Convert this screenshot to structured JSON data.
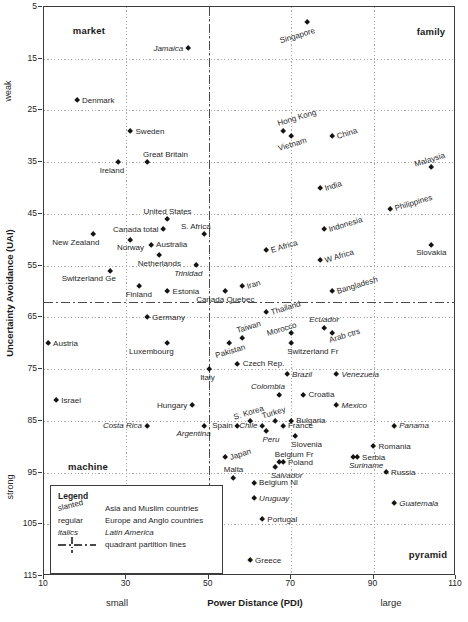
{
  "figure": {
    "quadrants": {
      "top_left": "market",
      "top_right": "family",
      "bottom_left": "machine",
      "bottom_right": "pyramid"
    },
    "axes": {
      "x_title": "Power Distance (PDI)",
      "x_left_label": "small",
      "x_right_label": "large",
      "y_title": "Uncertainty Avoidance (UAI)",
      "y_top_label": "weak",
      "y_bottom_label": "strong"
    },
    "legend": {
      "title": "Legend",
      "rows": [
        {
          "key": "slanted",
          "desc": "Asia and Muslim countries"
        },
        {
          "key": "regular",
          "desc": "Europe and Anglo countries"
        },
        {
          "key": "italics",
          "desc": "Latin America"
        },
        {
          "key": "partition-line-symbol",
          "desc": "quadrant partition lines"
        }
      ]
    }
  },
  "chart_data": {
    "type": "scatter",
    "xlabel": "Power Distance (PDI)",
    "ylabel": "Uncertainty Avoidance (UAI)",
    "xlim": [
      10,
      110
    ],
    "ylim": [
      5,
      115
    ],
    "y_axis_inverted": true,
    "x_ticks": [
      10,
      30,
      50,
      70,
      90,
      110
    ],
    "y_ticks": [
      5,
      15,
      25,
      35,
      45,
      55,
      65,
      75,
      85,
      95,
      105,
      115
    ],
    "x_gridlines": [
      30,
      50,
      70,
      90
    ],
    "y_gridlines": [
      15,
      25,
      35,
      45,
      55,
      65,
      75,
      85,
      95,
      105
    ],
    "partition_lines": {
      "x": 50,
      "y": 62
    },
    "group_legend": {
      "slanted": "Asia and Muslim countries",
      "regular": "Europe and Anglo countries",
      "italics": "Latin America"
    },
    "points": [
      {
        "name": "Singapore",
        "pdi": 74,
        "uai": 8,
        "group": "slanted",
        "pos": "below-left"
      },
      {
        "name": "Jamaica",
        "pdi": 45,
        "uai": 13,
        "group": "italics",
        "pos": "left"
      },
      {
        "name": "Denmark",
        "pdi": 18,
        "uai": 23,
        "group": "regular",
        "pos": "right"
      },
      {
        "name": "Sweden",
        "pdi": 31,
        "uai": 29,
        "group": "regular",
        "pos": "right"
      },
      {
        "name": "Hong Kong",
        "pdi": 68,
        "uai": 29,
        "group": "slanted",
        "pos": "above-right"
      },
      {
        "name": "Vietnam",
        "pdi": 70,
        "uai": 30,
        "group": "slanted",
        "pos": "below"
      },
      {
        "name": "China",
        "pdi": 80,
        "uai": 30,
        "group": "slanted",
        "pos": "right"
      },
      {
        "name": "Great Britain",
        "pdi": 35,
        "uai": 35,
        "group": "regular",
        "pos": "above-right"
      },
      {
        "name": "Ireland",
        "pdi": 28,
        "uai": 35,
        "group": "regular",
        "pos": "below-left"
      },
      {
        "name": "Malaysia",
        "pdi": 104,
        "uai": 36,
        "group": "slanted",
        "pos": "above"
      },
      {
        "name": "India",
        "pdi": 77,
        "uai": 40,
        "group": "slanted",
        "pos": "right"
      },
      {
        "name": "Philippines",
        "pdi": 94,
        "uai": 44,
        "group": "slanted",
        "pos": "right"
      },
      {
        "name": "United States",
        "pdi": 40,
        "uai": 46,
        "group": "regular",
        "pos": "above"
      },
      {
        "name": "Canada total",
        "pdi": 39,
        "uai": 48,
        "group": "regular",
        "pos": "left"
      },
      {
        "name": "S. Africa",
        "pdi": 49,
        "uai": 49,
        "group": "regular",
        "pos": "above-left"
      },
      {
        "name": "Indonesia",
        "pdi": 78,
        "uai": 48,
        "group": "slanted",
        "pos": "right"
      },
      {
        "name": "New Zealand",
        "pdi": 22,
        "uai": 49,
        "group": "regular",
        "pos": "below-left"
      },
      {
        "name": "Norway",
        "pdi": 31,
        "uai": 50,
        "group": "regular",
        "pos": "below"
      },
      {
        "name": "Australia",
        "pdi": 36,
        "uai": 51,
        "group": "regular",
        "pos": "right"
      },
      {
        "name": "Slovakia",
        "pdi": 104,
        "uai": 51,
        "group": "regular",
        "pos": "below"
      },
      {
        "name": "E Africa",
        "pdi": 64,
        "uai": 52,
        "group": "slanted",
        "pos": "right"
      },
      {
        "name": "Netherlands",
        "pdi": 38,
        "uai": 53,
        "group": "regular",
        "pos": "below"
      },
      {
        "name": "W Africa",
        "pdi": 77,
        "uai": 54,
        "group": "slanted",
        "pos": "right"
      },
      {
        "name": "Trinidad",
        "pdi": 47,
        "uai": 55,
        "group": "italics",
        "pos": "below-left"
      },
      {
        "name": "Switzerland Ge",
        "pdi": 26,
        "uai": 56,
        "group": "regular",
        "pos": "below-left"
      },
      {
        "name": "Iran",
        "pdi": 58,
        "uai": 59,
        "group": "slanted",
        "pos": "right"
      },
      {
        "name": "Finland",
        "pdi": 33,
        "uai": 59,
        "group": "regular",
        "pos": "below"
      },
      {
        "name": "Estonia",
        "pdi": 40,
        "uai": 60,
        "group": "regular",
        "pos": "right"
      },
      {
        "name": "Canada Quebec",
        "pdi": 54,
        "uai": 60,
        "group": "regular",
        "pos": "below"
      },
      {
        "name": "Bangladesh",
        "pdi": 80,
        "uai": 60,
        "group": "slanted",
        "pos": "right"
      },
      {
        "name": "Germany",
        "pdi": 35,
        "uai": 65,
        "group": "regular",
        "pos": "right"
      },
      {
        "name": "Thailand",
        "pdi": 64,
        "uai": 64,
        "group": "slanted",
        "pos": "right"
      },
      {
        "name": "Ecuador",
        "pdi": 78,
        "uai": 67,
        "group": "italics",
        "pos": "above"
      },
      {
        "name": "Taiwan",
        "pdi": 58,
        "uai": 69,
        "group": "slanted",
        "pos": "above-right"
      },
      {
        "name": "Morocco",
        "pdi": 70,
        "uai": 68,
        "group": "slanted",
        "pos": "above-left"
      },
      {
        "name": "Arab ctrs",
        "pdi": 80,
        "uai": 68,
        "group": "slanted",
        "pos": "below-right"
      },
      {
        "name": "Austria",
        "pdi": 11,
        "uai": 70,
        "group": "regular",
        "pos": "right"
      },
      {
        "name": "Luxembourg",
        "pdi": 40,
        "uai": 70,
        "group": "regular",
        "pos": "below-left"
      },
      {
        "name": "Pakistan",
        "pdi": 55,
        "uai": 70,
        "group": "slanted",
        "pos": "below"
      },
      {
        "name": "Switzerland Fr",
        "pdi": 70,
        "uai": 70,
        "group": "regular",
        "pos": "below-right"
      },
      {
        "name": "Czech Rep.",
        "pdi": 57,
        "uai": 74,
        "group": "regular",
        "pos": "right"
      },
      {
        "name": "Italy",
        "pdi": 50,
        "uai": 75,
        "group": "regular",
        "pos": "below-left"
      },
      {
        "name": "Brazil",
        "pdi": 69,
        "uai": 76,
        "group": "italics",
        "pos": "right"
      },
      {
        "name": "Venezuela",
        "pdi": 81,
        "uai": 76,
        "group": "italics",
        "pos": "right"
      },
      {
        "name": "Israel",
        "pdi": 13,
        "uai": 81,
        "group": "regular",
        "pos": "right"
      },
      {
        "name": "Colombia",
        "pdi": 67,
        "uai": 80,
        "group": "italics",
        "pos": "above-left"
      },
      {
        "name": "Croatia",
        "pdi": 73,
        "uai": 80,
        "group": "regular",
        "pos": "right"
      },
      {
        "name": "Hungary",
        "pdi": 46,
        "uai": 82,
        "group": "regular",
        "pos": "left"
      },
      {
        "name": "Mexico",
        "pdi": 81,
        "uai": 82,
        "group": "italics",
        "pos": "right"
      },
      {
        "name": "Costa Rica",
        "pdi": 35,
        "uai": 86,
        "group": "italics",
        "pos": "left"
      },
      {
        "name": "S. Korea",
        "pdi": 60,
        "uai": 85,
        "group": "slanted",
        "pos": "above"
      },
      {
        "name": "Turkey",
        "pdi": 66,
        "uai": 85,
        "group": "slanted",
        "pos": "above"
      },
      {
        "name": "Bulgaria",
        "pdi": 70,
        "uai": 85,
        "group": "regular",
        "pos": "right"
      },
      {
        "name": "Argentina",
        "pdi": 49,
        "uai": 86,
        "group": "italics",
        "pos": "below-left"
      },
      {
        "name": "Spain",
        "pdi": 57,
        "uai": 86,
        "group": "regular",
        "pos": "left"
      },
      {
        "name": "Chile",
        "pdi": 63,
        "uai": 86,
        "group": "italics",
        "pos": "left"
      },
      {
        "name": "France",
        "pdi": 68,
        "uai": 86,
        "group": "regular",
        "pos": "right"
      },
      {
        "name": "Peru",
        "pdi": 64,
        "uai": 87,
        "group": "italics",
        "pos": "below-right"
      },
      {
        "name": "Panama",
        "pdi": 95,
        "uai": 86,
        "group": "italics",
        "pos": "right"
      },
      {
        "name": "Slovenia",
        "pdi": 71,
        "uai": 88,
        "group": "regular",
        "pos": "below-right"
      },
      {
        "name": "Japan",
        "pdi": 54,
        "uai": 92,
        "group": "slanted",
        "pos": "right"
      },
      {
        "name": "Romania",
        "pdi": 90,
        "uai": 90,
        "group": "regular",
        "pos": "right"
      },
      {
        "name": "Belgium Fr",
        "pdi": 67,
        "uai": 93,
        "group": "regular",
        "pos": "above-right"
      },
      {
        "name": "Serbia",
        "pdi": 86,
        "uai": 92,
        "group": "regular",
        "pos": "right"
      },
      {
        "name": "Suriname",
        "pdi": 85,
        "uai": 92,
        "group": "italics",
        "pos": "below-right"
      },
      {
        "name": "Poland",
        "pdi": 68,
        "uai": 93,
        "group": "regular",
        "pos": "right"
      },
      {
        "name": "Salvador",
        "pdi": 66,
        "uai": 94,
        "group": "italics",
        "pos": "below-right"
      },
      {
        "name": "Malta",
        "pdi": 56,
        "uai": 96,
        "group": "regular",
        "pos": "above"
      },
      {
        "name": "Russia",
        "pdi": 93,
        "uai": 95,
        "group": "regular",
        "pos": "right"
      },
      {
        "name": "Belgium Nl",
        "pdi": 61,
        "uai": 97,
        "group": "regular",
        "pos": "right"
      },
      {
        "name": "Uruguay",
        "pdi": 61,
        "uai": 100,
        "group": "italics",
        "pos": "right"
      },
      {
        "name": "Guatemala",
        "pdi": 95,
        "uai": 101,
        "group": "italics",
        "pos": "right"
      },
      {
        "name": "Portugal",
        "pdi": 63,
        "uai": 104,
        "group": "regular",
        "pos": "right"
      },
      {
        "name": "Greece",
        "pdi": 60,
        "uai": 112,
        "group": "regular",
        "pos": "right"
      }
    ]
  }
}
